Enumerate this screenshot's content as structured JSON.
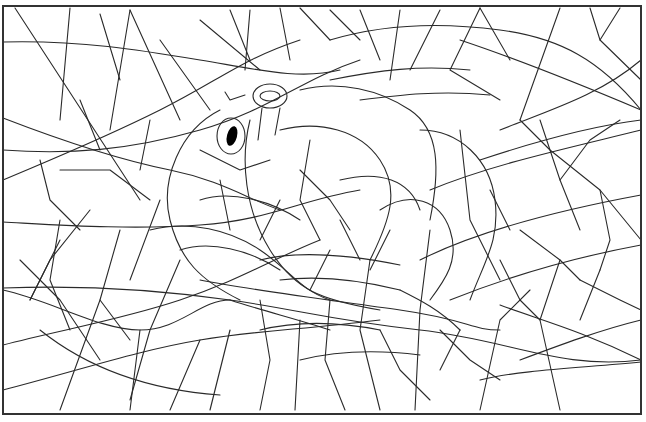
{
  "image": {
    "title": "",
    "kind": "mosaic-coloring-page",
    "subject": "hidden frog head in mosaic line art",
    "width": 646,
    "height": 422
  },
  "colors": {
    "background": "#ffffff",
    "line": "#2a2a2a",
    "frame": "#333333",
    "pupil": "#000000"
  },
  "frame": {
    "x": 3,
    "y": 6,
    "width": 638,
    "height": 408
  }
}
